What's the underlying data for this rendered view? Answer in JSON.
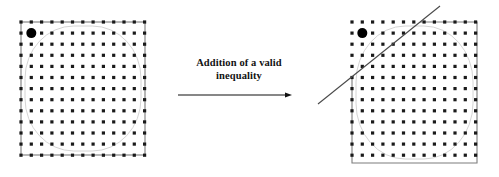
{
  "figure": {
    "width": 499,
    "height": 177,
    "background": "#ffffff",
    "ink_color": "#1a1a1a",
    "grid_line_color": "#9a9a9a",
    "feasible_region_color": "#cfcfcf"
  },
  "caption": {
    "line1": "Addition of a valid",
    "line2": "inequality",
    "full_text": "Addition of a valid inequality"
  },
  "arrow": {
    "label": "transformation-arrow",
    "x1": 178,
    "y1": 95,
    "x2": 292,
    "y2": 95,
    "color": "#111111"
  },
  "left_panel": {
    "label": "original-formulation",
    "square": {
      "x": 21,
      "y": 22,
      "width": 124,
      "height": 133
    },
    "grid": {
      "columns": 13,
      "rows": 13,
      "spacing_x": 10.3,
      "spacing_y": 11.1,
      "origin_x": 21,
      "origin_y": 22,
      "dot_radius": 1.6,
      "dot_color": "#1a1a1a"
    },
    "highlight_point": {
      "label": "integer-optimum-point",
      "col": 1,
      "row": 1,
      "radius": 5.0,
      "color": "#000000"
    },
    "cut_line": null
  },
  "right_panel": {
    "label": "strengthened-formulation",
    "square": {
      "x": 352,
      "y": 22,
      "width": 125,
      "height": 141
    },
    "grid": {
      "columns": 13,
      "rows": 13,
      "spacing_x": 10.3,
      "spacing_y": 11.1,
      "origin_x": 352,
      "origin_y": 22,
      "dot_radius": 1.6,
      "dot_color": "#1a1a1a"
    },
    "highlight_point": {
      "label": "integer-optimum-point",
      "col": 1,
      "row": 1,
      "radius": 5.0,
      "color": "#000000"
    },
    "cut_line": {
      "label": "valid-inequality-cut",
      "x1": 318,
      "y1": 104,
      "x2": 440,
      "y2": 6,
      "color": "#4a4a4a",
      "width": 1.1
    }
  }
}
